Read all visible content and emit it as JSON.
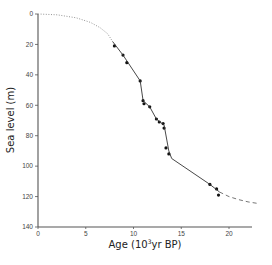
{
  "chart_data": {
    "type": "line",
    "title": "",
    "xlabel": "Age (10³yr BP)",
    "xlabel_base": "Age (10",
    "xlabel_sup": "3",
    "xlabel_tail": "yr BP)",
    "ylabel": "Sea level (m)",
    "xlim": [
      0,
      23
    ],
    "ylim": [
      0,
      140
    ],
    "y_inverted": true,
    "grid": false,
    "legend": null,
    "x_ticks": [
      "0",
      "5",
      "10",
      "15",
      "20"
    ],
    "y_ticks": [
      "0",
      "20",
      "40",
      "60",
      "80",
      "100",
      "120",
      "140"
    ],
    "series": [
      {
        "name": "measured points",
        "style": "markers",
        "x": [
          8.0,
          8.9,
          9.3,
          10.7,
          11.0,
          11.1,
          11.7,
          12.4,
          12.7,
          13.1,
          13.2,
          13.4,
          13.7,
          18.0,
          18.7,
          18.9
        ],
        "y": [
          21,
          27,
          32,
          44,
          57,
          59,
          61,
          69,
          71,
          72,
          75,
          88,
          92,
          112,
          115,
          119
        ]
      },
      {
        "name": "fitted curve",
        "style": "solid",
        "x": [
          7.8,
          8.9,
          10.7,
          11.0,
          11.7,
          12.4,
          13.2,
          13.7,
          14.0,
          18.0,
          19.0
        ],
        "y": [
          18,
          27,
          44,
          57,
          61,
          69,
          73,
          90,
          95,
          112,
          117
        ]
      },
      {
        "name": "extrapolation young",
        "style": "dotted",
        "x": [
          0,
          2,
          4,
          5.5,
          6.5,
          7.3,
          7.8
        ],
        "y": [
          0,
          0.5,
          2.5,
          5.5,
          9,
          13,
          18
        ]
      },
      {
        "name": "extrapolation old",
        "style": "dashed",
        "x": [
          19.0,
          20.0,
          21.0,
          22.0,
          23.0
        ],
        "y": [
          117,
          120,
          122,
          123.5,
          124.5
        ]
      }
    ]
  }
}
